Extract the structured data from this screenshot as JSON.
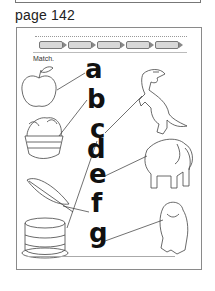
{
  "page": {
    "label": "page 142"
  },
  "worksheet": {
    "heading": "Match.",
    "instructions": "Color crayons, then draw lines matching each picture to its beginning letter.",
    "crayon_count": 5,
    "letters": [
      "a",
      "b",
      "c",
      "d",
      "e",
      "f",
      "g"
    ],
    "pictures_left": [
      "apple",
      "basket",
      "feather",
      "cake"
    ],
    "pictures_right": [
      "dinosaur",
      "elephant",
      "gorilla"
    ],
    "matches": [
      {
        "letter": "a",
        "picture": "apple"
      },
      {
        "letter": "b",
        "picture": "basket"
      },
      {
        "letter": "c",
        "picture": "dinosaur"
      },
      {
        "letter": "d",
        "picture": "cake"
      },
      {
        "letter": "e",
        "picture": "elephant"
      },
      {
        "letter": "f",
        "picture": "feather"
      },
      {
        "letter": "g",
        "picture": "gorilla"
      }
    ]
  }
}
